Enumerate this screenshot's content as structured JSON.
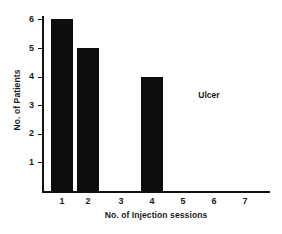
{
  "chart_data": {
    "type": "bar",
    "title": "",
    "subtitle": "",
    "xlabel": "No. of Injection sessions",
    "ylabel": "No. of Patients",
    "categories": [
      "1",
      "2",
      "3",
      "4",
      "5",
      "6",
      "7"
    ],
    "values": [
      6,
      5,
      0,
      4,
      0,
      0,
      0
    ],
    "series": [
      {
        "name": "Ulcer",
        "values": [
          6,
          5,
          0,
          4,
          0,
          0,
          0
        ],
        "color": "#0d0d0d"
      }
    ],
    "annotations": [
      {
        "text": "Ulcer",
        "x": 5.6,
        "y": 3.4
      }
    ],
    "xlim": [
      0.4,
      8.0
    ],
    "ylim": [
      0,
      6.2
    ],
    "yticks": [
      1,
      2,
      3,
      4,
      5,
      6
    ],
    "ytick_labels": [
      "1",
      "2",
      "3",
      "4",
      "5",
      "6"
    ],
    "xtick_labels": [
      "1",
      "2",
      "3",
      "4",
      "5",
      "6",
      "7"
    ],
    "grid": false,
    "legend": false,
    "legend_position": "none",
    "bar_color": "#0d0d0d",
    "axis_color": "#111111",
    "background_color": "#ffffff"
  },
  "geometry": {
    "plot_left": 42,
    "plot_right": 270,
    "plot_top": 16,
    "baseline": 191,
    "y_value_top": 20,
    "px_per_unit": 28.6,
    "bar_width": 22,
    "bar_left_positions": [
      51,
      77,
      110,
      141,
      172,
      203,
      234
    ]
  }
}
